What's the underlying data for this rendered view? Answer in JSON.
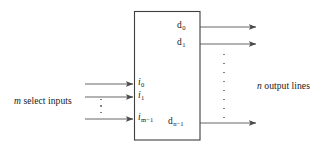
{
  "diagram": {
    "line_color": "#4a4a4a",
    "box_color": "#3f3f3f",
    "dot_color": "#6e6e6e",
    "box": {
      "x": 134,
      "y": 11,
      "width": 66,
      "height": 129
    }
  },
  "inputs": {
    "caption": "select inputs",
    "caption_symbol": "m",
    "caption_full": "m select inputs",
    "ports": [
      {
        "base": "i",
        "sub": "0",
        "label": "i0",
        "y": 84
      },
      {
        "base": "i",
        "sub": "1",
        "label": "i1",
        "y": 97
      },
      {
        "base": "i",
        "sub": "m−1",
        "label": "im−1",
        "y": 119
      }
    ],
    "ellipsis_dots": 3
  },
  "outputs": {
    "caption": "output lines",
    "caption_symbol": "n",
    "caption_full": "n output lines",
    "ports": [
      {
        "base": "d",
        "sub": "0",
        "label": "d0",
        "y": 27
      },
      {
        "base": "d",
        "sub": "1",
        "label": "d1",
        "y": 44
      },
      {
        "base": "d",
        "sub": "n−1",
        "label": "dn−1",
        "y": 123
      }
    ],
    "ellipsis_dots": 8
  }
}
